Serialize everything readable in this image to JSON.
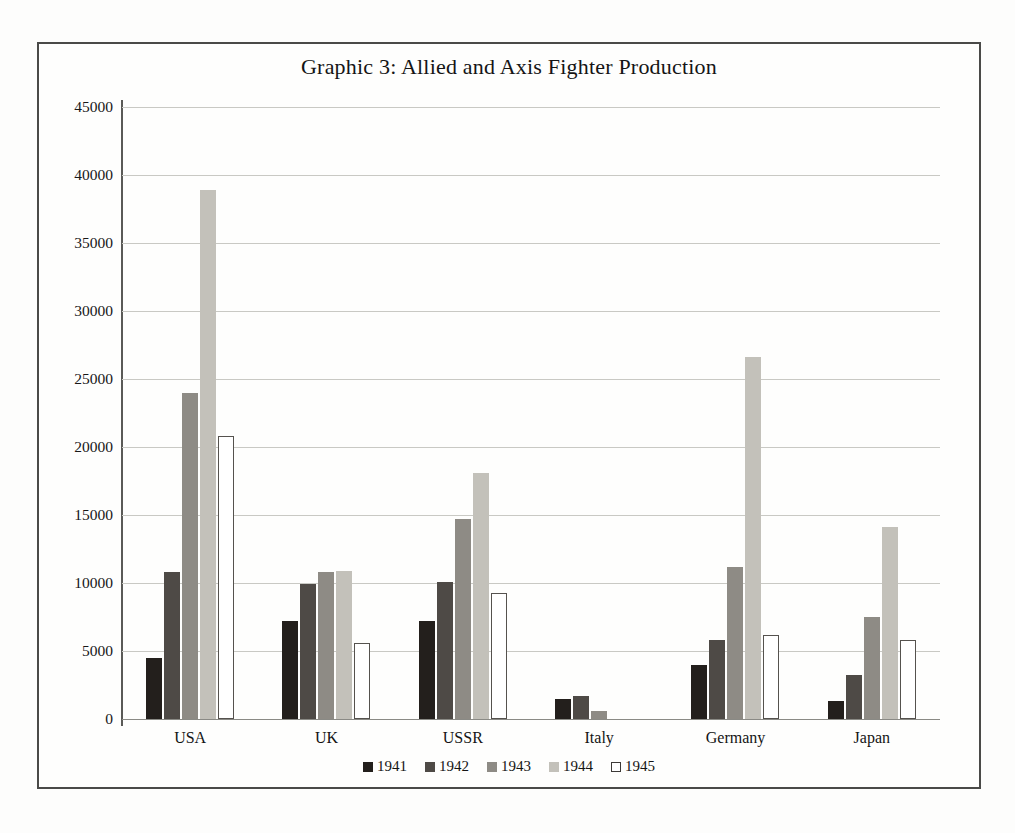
{
  "chart_data": {
    "type": "bar",
    "title": "Graphic 3: Allied and Axis Fighter Production",
    "xlabel": "",
    "ylabel": "",
    "ylim": [
      0,
      45000
    ],
    "ytick_step": 5000,
    "yticks": [
      "45000",
      "40000",
      "35000",
      "30000",
      "25000",
      "20000",
      "15000",
      "10000",
      "5000",
      "0"
    ],
    "grid": true,
    "legend_position": "bottom",
    "categories": [
      "USA",
      "UK",
      "USSR",
      "Italy",
      "Germany",
      "Japan"
    ],
    "series": [
      {
        "name": "1941",
        "color": "#231f1c",
        "values": [
          4500,
          7200,
          7200,
          1500,
          4000,
          1300
        ]
      },
      {
        "name": "1942",
        "color": "#4e4a46",
        "values": [
          10800,
          9900,
          10100,
          1700,
          5800,
          3200
        ]
      },
      {
        "name": "1943",
        "color": "#8e8b85",
        "values": [
          24000,
          10800,
          14700,
          600,
          11200,
          7500
        ]
      },
      {
        "name": "1944",
        "color": "#c3c1ba",
        "values": [
          38900,
          10900,
          18100,
          0,
          26600,
          14100
        ]
      },
      {
        "name": "1945",
        "color": "#ffffff",
        "values": [
          20800,
          5600,
          9300,
          0,
          6200,
          5800
        ]
      }
    ]
  },
  "legend": {
    "items": [
      {
        "label": "1941"
      },
      {
        "label": "1942"
      },
      {
        "label": "1943"
      },
      {
        "label": "1944"
      },
      {
        "label": "1945"
      }
    ]
  }
}
